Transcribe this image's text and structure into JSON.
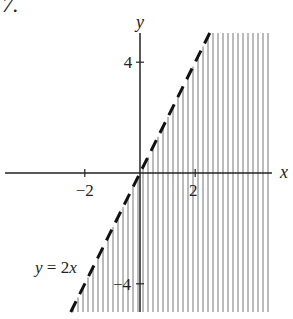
{
  "problem_number": "7.",
  "chart_data": {
    "type": "inequality-region",
    "title": "",
    "xlabel": "x",
    "ylabel": "y",
    "x_ticks": [
      -2,
      2
    ],
    "y_ticks": [
      4,
      -4
    ],
    "x_tick_labels": [
      "−2",
      "2"
    ],
    "y_tick_labels": [
      "4",
      "−4"
    ],
    "xlim": [
      -5,
      5
    ],
    "ylim": [
      -5,
      5
    ],
    "boundary": {
      "equation": "y = 2x",
      "style": "dashed",
      "label": "y = 2x"
    },
    "shaded_region": "y < 2x (right/below the line)",
    "shading": "vertical hatch lines",
    "grid": false
  },
  "colors": {
    "ink": "#222222",
    "hatch": "#777777"
  }
}
